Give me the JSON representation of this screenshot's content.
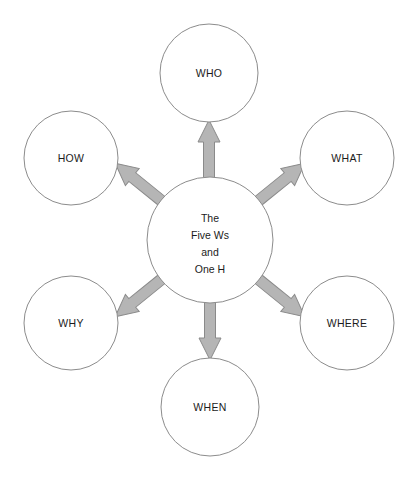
{
  "diagram": {
    "type": "hub-and-spoke",
    "background_color": "#ffffff",
    "circle_stroke_color": "#8c8c8c",
    "arrow_fill_color": "#b5b5b5",
    "arrow_stroke_color": "#8a8a8a",
    "label_color": "#1b1b1b",
    "hub": {
      "name": "five-ws-one-h",
      "lines": [
        "The",
        "Five Ws",
        "and",
        "One H"
      ],
      "line_1": "The",
      "line_2": "Five Ws",
      "line_3": "and",
      "line_4": "One H",
      "cx": 210,
      "cy": 240,
      "r": 63
    },
    "nodes": [
      {
        "id": "who",
        "label": "WHO",
        "cx": 209,
        "cy": 73,
        "r": 49,
        "direction": "up"
      },
      {
        "id": "what",
        "label": "WHAT",
        "cx": 347,
        "cy": 158,
        "r": 47,
        "direction": "up-right"
      },
      {
        "id": "where",
        "label": "WHERE",
        "cx": 347,
        "cy": 323,
        "r": 47,
        "direction": "down-right"
      },
      {
        "id": "when",
        "label": "WHEN",
        "cx": 210,
        "cy": 407,
        "r": 49,
        "direction": "down"
      },
      {
        "id": "why",
        "label": "WHY",
        "cx": 71,
        "cy": 323,
        "r": 47,
        "direction": "down-left"
      },
      {
        "id": "how",
        "label": "HOW",
        "cx": 71,
        "cy": 158,
        "r": 47,
        "direction": "up-left"
      }
    ],
    "arrows": [
      {
        "id": "arrow-to-who",
        "from": "five-ws-one-h",
        "to": "who",
        "direction": "up"
      },
      {
        "id": "arrow-to-what",
        "from": "five-ws-one-h",
        "to": "what",
        "direction": "up-right"
      },
      {
        "id": "arrow-to-where",
        "from": "five-ws-one-h",
        "to": "where",
        "direction": "down-right"
      },
      {
        "id": "arrow-to-when",
        "from": "five-ws-one-h",
        "to": "when",
        "direction": "down"
      },
      {
        "id": "arrow-to-why",
        "from": "five-ws-one-h",
        "to": "why",
        "direction": "down-left"
      },
      {
        "id": "arrow-to-how",
        "from": "five-ws-one-h",
        "to": "how",
        "direction": "up-left"
      }
    ]
  }
}
